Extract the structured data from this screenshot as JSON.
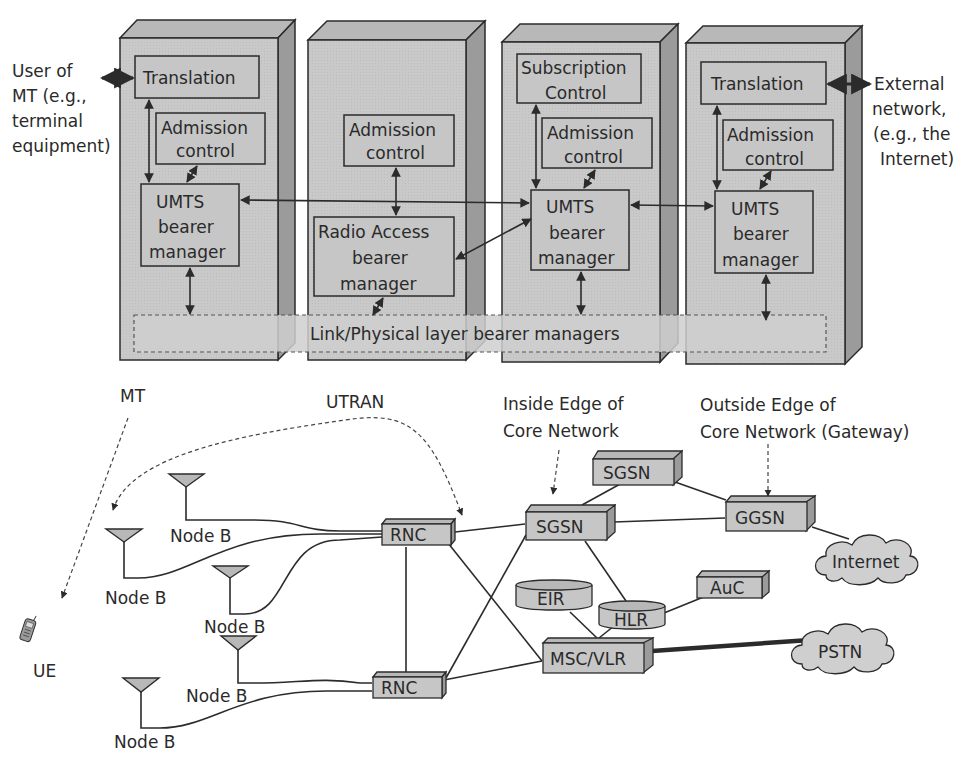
{
  "colors": {
    "panel_front": "#c9c9c9",
    "panel_top": "#b8b8b8",
    "panel_side": "#9b9b9b",
    "box_fill": "#c6c6c6",
    "stroke": "#2b2b2b",
    "cloud_fill": "#cfcfcf",
    "background": "#ffffff"
  },
  "top_diagram": {
    "left_label": [
      "User of",
      "MT (e.g.,",
      "terminal",
      "equipment)"
    ],
    "right_label": [
      "External",
      "network,",
      "(e.g., the",
      "Internet)"
    ],
    "link_layer_label": "Link/Physical layer bearer managers",
    "panels": [
      {
        "name": "MT",
        "boxes": {
          "translation": "Translation",
          "admission": [
            "Admission",
            "control"
          ],
          "bearer": [
            "UMTS",
            "bearer",
            "manager"
          ]
        }
      },
      {
        "name": "UTRAN",
        "boxes": {
          "admission": [
            "Admission",
            "control"
          ],
          "bearer": [
            "Radio Access",
            "bearer",
            "manager"
          ]
        }
      },
      {
        "name": "CN Edge",
        "boxes": {
          "subscription": [
            "Subscription",
            "Control"
          ],
          "admission": [
            "Admission",
            "control"
          ],
          "bearer": [
            "UMTS",
            "bearer",
            "manager"
          ]
        }
      },
      {
        "name": "CN Gateway",
        "boxes": {
          "translation": "Translation",
          "admission": [
            "Admission",
            "control"
          ],
          "bearer": [
            "UMTS",
            "bearer",
            "manager"
          ]
        }
      }
    ]
  },
  "bottom_diagram": {
    "labels": {
      "mt": "MT",
      "utran": "UTRAN",
      "inside_edge": [
        "Inside Edge of",
        "Core Network"
      ],
      "outside_edge": [
        "Outside Edge of",
        "Core Network (Gateway)"
      ],
      "ue": "UE"
    },
    "node_b_label": "Node B",
    "nodes": {
      "rnc_top": "RNC",
      "rnc_bottom": "RNC",
      "sgsn_top": "SGSN",
      "sgsn_main": "SGSN",
      "ggsn": "GGSN",
      "eir": "EIR",
      "hlr": "HLR",
      "auc": "AuC",
      "msc_vlr": "MSC/VLR",
      "internet": "Internet",
      "pstn": "PSTN"
    }
  }
}
